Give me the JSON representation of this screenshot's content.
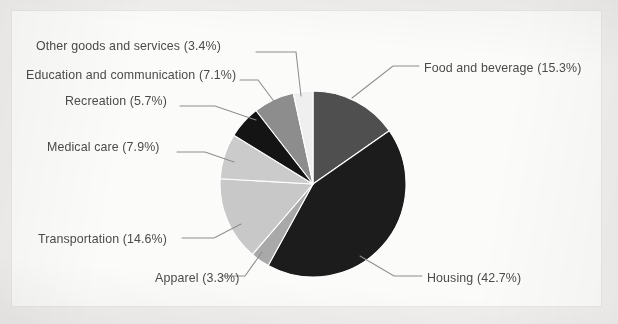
{
  "chart_data": {
    "type": "pie",
    "title": "",
    "subtitle": "",
    "xlabel": "",
    "ylabel": "",
    "legend_position": "none",
    "labels_style": "callout-with-leader-line",
    "units": "percent",
    "start_angle_deg": 0,
    "direction": "clockwise",
    "total": 100.0,
    "categories": [
      "Food and beverage",
      "Housing",
      "Apparel",
      "Transportation",
      "Medical care",
      "Recreation",
      "Education and communication",
      "Other goods and services"
    ],
    "values": [
      15.3,
      42.7,
      3.3,
      14.6,
      7.9,
      5.7,
      7.1,
      3.4
    ],
    "slices": [
      {
        "name": "Food and beverage",
        "value": 15.3,
        "label": "Food and beverage (15.3%)",
        "color": "#4f4f4f",
        "label_side": "right",
        "label_x": 424,
        "label_y": 62,
        "leader": "M 352,98 L 393,66 L 419,66"
      },
      {
        "name": "Housing",
        "value": 42.7,
        "label": "Housing (42.7%)",
        "color": "#1c1c1c",
        "label_side": "right",
        "label_x": 427,
        "label_y": 272,
        "leader": "M 360,256 L 394,276 L 422,276"
      },
      {
        "name": "Apparel",
        "value": 3.3,
        "label": "Apparel (3.3%)",
        "color": "#a9a9a9",
        "label_side": "left",
        "label_x": 155,
        "label_y": 272,
        "leader": "M 262,252 L 245,276 L 222,276"
      },
      {
        "name": "Transportation",
        "value": 14.6,
        "label": "Transportation (14.6%)",
        "color": "#c8c8c8",
        "label_side": "left",
        "label_x": 38,
        "label_y": 233,
        "leader": "M 241,224 L 214,238 L 182,238"
      },
      {
        "name": "Medical care",
        "value": 7.9,
        "label": "Medical care (7.9%)",
        "color": "#cbcbcb",
        "label_side": "left",
        "label_x": 47,
        "label_y": 141,
        "leader": "M 234,162 L 205,152 L 177,152"
      },
      {
        "name": "Recreation",
        "value": 5.7,
        "label": "Recreation (5.7%)",
        "color": "#141414",
        "label_side": "left",
        "label_x": 65,
        "label_y": 95,
        "leader": "M 256,120 L 215,106 L 180,106"
      },
      {
        "name": "Education and communication",
        "value": 7.1,
        "label": "Education and communication (7.1%)",
        "color": "#8d8d8d",
        "label_side": "left",
        "label_x": 26,
        "label_y": 69,
        "leader": "M 276,104 L 258,80 L 240,80"
      },
      {
        "name": "Other goods and services",
        "value": 3.4,
        "label": "Other goods and services (3.4%)",
        "color": "#efefef",
        "label_side": "left",
        "label_x": 36,
        "label_y": 40,
        "leader": "M 301,96 L 296,52 L 256,52"
      }
    ],
    "geometry": {
      "center_x": 313,
      "center_y": 184,
      "radius": 93
    },
    "colors": {
      "background": "#fbfbfa",
      "page_background": "#f0efed",
      "label_text": "#4b4b4b",
      "leader_line": "#8d8d8d",
      "slice_separator": "#ffffff"
    }
  }
}
